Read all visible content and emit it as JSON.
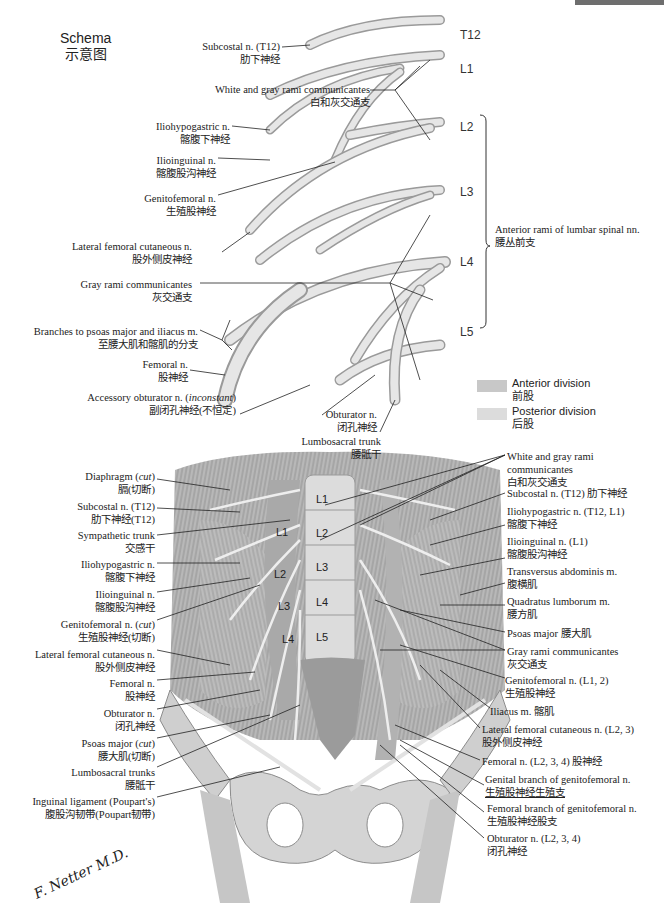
{
  "schema": {
    "title_en": "Schema",
    "title_cn": "示意图",
    "levels": [
      "T12",
      "L1",
      "L2",
      "L3",
      "L4",
      "L5"
    ],
    "bracket_label_en": "Anterior rami of lumbar spinal nn.",
    "bracket_label_cn": "腰丛前支",
    "left_labels": [
      {
        "en": "Subcostal n. (T12)",
        "cn": "肋下神经"
      },
      {
        "en": "White and gray rami communicantes",
        "cn": "白和灰交通支"
      },
      {
        "en": "Iliohypogastric n.",
        "cn": "髂腹下神经"
      },
      {
        "en": "Ilioinguinal n.",
        "cn": "髂腹股沟神经"
      },
      {
        "en": "Genitofemoral n.",
        "cn": "生殖股神经"
      },
      {
        "en": "Lateral femoral cutaneous n.",
        "cn": "股外侧皮神经"
      },
      {
        "en": "Gray rami communicantes",
        "cn": "灰交通支"
      },
      {
        "en": "Branches to psoas major and iliacus m.",
        "cn": "至腰大肌和髂肌的分支"
      },
      {
        "en": "Femoral n.",
        "cn": "股神经"
      },
      {
        "en": "Accessory obturator n. (",
        "en_italic": "inconstant",
        "en_end": ")",
        "cn": "副闭孔神经(不恒定)"
      }
    ],
    "bottom_labels": [
      {
        "en": "Obturator n.",
        "cn": "闭孔神经"
      },
      {
        "en": "Lumbosacral trunk",
        "cn": "腰骶干"
      }
    ],
    "legend": [
      {
        "en": "Anterior division",
        "cn": "前股",
        "color": "#c8c8c8"
      },
      {
        "en": "Posterior division",
        "cn": "后股",
        "color": "#dcdcdc"
      }
    ]
  },
  "dissection": {
    "vertebra_labels": [
      "L1",
      "L2",
      "L3",
      "L4",
      "L5"
    ],
    "side_root_labels": [
      "L1",
      "L2",
      "L3",
      "L4"
    ],
    "left_labels": [
      {
        "en": "Diaphragm (",
        "en_italic": "cut",
        "en_end": ")",
        "cn": "膈(切断)"
      },
      {
        "en": "Subcostal n. (T12)",
        "cn": "肋下神经(T12)"
      },
      {
        "en": "Sympathetic trunk",
        "cn": "交感干"
      },
      {
        "en": "Iliohypogastric n.",
        "cn": "髂腹下神经"
      },
      {
        "en": "Ilioinguinal n.",
        "cn": "髂腹股沟神经"
      },
      {
        "en": "Genitofemoral n. (",
        "en_italic": "cut",
        "en_end": ")",
        "cn": "生殖股神经(切断)"
      },
      {
        "en": "Lateral femoral cutaneous n.",
        "cn": "股外侧皮神经"
      },
      {
        "en": "Femoral n.",
        "cn": "股神经"
      },
      {
        "en": "Obturator n.",
        "cn": "闭孔神经"
      },
      {
        "en": "Psoas major (",
        "en_italic": "cut",
        "en_end": ")",
        "cn": "腰大肌(切断)"
      },
      {
        "en": "Lumbosacral trunks",
        "cn": "腰骶干"
      },
      {
        "en": "Inguinal ligament (Poupart's)",
        "cn": "腹股沟韧带(Poupart韧带)"
      }
    ],
    "right_labels": [
      {
        "en": "White and gray rami",
        "en2": "communicantes",
        "cn": "白和灰交通支"
      },
      {
        "en": "Subcostal n. (T12) 肋下神经"
      },
      {
        "en": "Iliohypogastric n. (T12, L1)",
        "cn": "髂腹下神经"
      },
      {
        "en": "Ilioinguinal n. (L1)",
        "cn": "髂腹股沟神经"
      },
      {
        "en": "Transversus abdominis m.",
        "cn": "腹横肌"
      },
      {
        "en": "Quadratus lumborum m.",
        "cn": "腰方肌"
      },
      {
        "en": "Psoas major 腰大肌"
      },
      {
        "en": "Gray rami communicantes",
        "cn": "灰交通支"
      },
      {
        "en": "Genitofemoral n. (L1, 2)",
        "cn": "生殖股神经"
      },
      {
        "en": "Iliacus m. 髂肌"
      },
      {
        "en": "Lateral femoral cutaneous n. (L2, 3)",
        "cn": "股外侧皮神经"
      },
      {
        "en": "Femoral n. (L2, 3, 4) 股神经"
      },
      {
        "en": "Genital branch of genitofemoral n.",
        "cn": "生殖股神经生殖支"
      },
      {
        "en": "Femoral branch of genitofemoral n.",
        "cn": "生殖股神经股支"
      },
      {
        "en": "Obturator n. (L2, 3, 4)",
        "cn": "闭孔神经"
      }
    ]
  },
  "signature": "F. Netter M.D."
}
